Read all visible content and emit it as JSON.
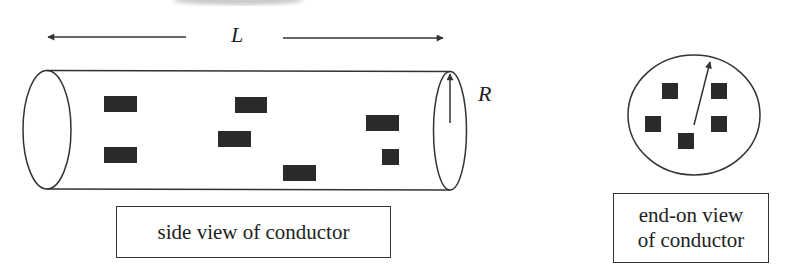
{
  "colors": {
    "stroke": "#333333",
    "charge_fill": "#2a2a2a",
    "smudge": "#9a9a9a",
    "background": "#ffffff"
  },
  "side_view": {
    "length_label": "L",
    "radius_label": "R",
    "caption": "side view of conductor",
    "cylinder": {
      "x_left": 47,
      "x_right": 450,
      "y_top": 71,
      "y_bottom": 189,
      "end_rx": 17
    },
    "charges": [
      {
        "x": 104,
        "y": 96,
        "w": 33,
        "h": 16
      },
      {
        "x": 104,
        "y": 147,
        "w": 33,
        "h": 16
      },
      {
        "x": 235,
        "y": 97,
        "w": 32,
        "h": 16
      },
      {
        "x": 218,
        "y": 131,
        "w": 33,
        "h": 16
      },
      {
        "x": 283,
        "y": 165,
        "w": 33,
        "h": 16
      },
      {
        "x": 366,
        "y": 115,
        "w": 33,
        "h": 16
      },
      {
        "x": 382,
        "y": 149,
        "w": 17,
        "h": 16
      }
    ]
  },
  "end_view": {
    "caption_line1": "end-on view",
    "caption_line2": "of conductor",
    "circle": {
      "cx": 694,
      "cy": 115,
      "rx": 66,
      "ry": 60
    },
    "charges": [
      {
        "x": 662,
        "y": 83,
        "w": 16,
        "h": 16
      },
      {
        "x": 711,
        "y": 83,
        "w": 16,
        "h": 16
      },
      {
        "x": 645,
        "y": 116,
        "w": 16,
        "h": 16
      },
      {
        "x": 711,
        "y": 116,
        "w": 16,
        "h": 16
      },
      {
        "x": 678,
        "y": 133,
        "w": 16,
        "h": 16
      }
    ]
  }
}
